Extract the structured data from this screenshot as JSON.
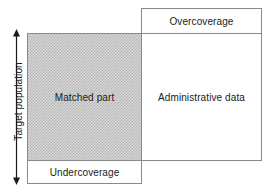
{
  "diagram": {
    "type": "venn-overlap-coverage-diagram",
    "axis": {
      "label": "Target population",
      "arrow_icon": "double-headed-vertical-arrow",
      "orientation": "vertical"
    },
    "regions": [
      {
        "id": "overcoverage",
        "label": "Overcoverage",
        "fill": "#ffffff",
        "stroke": "#8a8a8a"
      },
      {
        "id": "matched_part",
        "label": "Matched part",
        "fill": "#d6d6d6",
        "pattern": "checkerboard-dither-50",
        "stroke": "#8a8a8a"
      },
      {
        "id": "administrative_data",
        "label": "Administrative data",
        "fill": "#ffffff",
        "stroke": "#8a8a8a"
      },
      {
        "id": "undercoverage",
        "label": "Undercoverage",
        "fill": "#ffffff",
        "stroke": "#8a8a8a"
      }
    ]
  }
}
